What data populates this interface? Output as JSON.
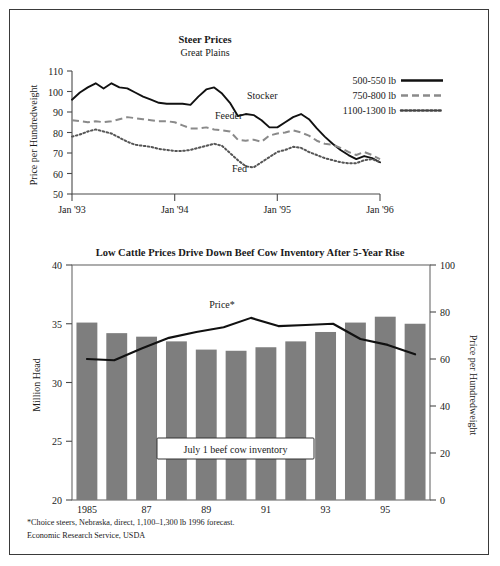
{
  "figure": {
    "footnotes": [
      "*Choice steers, Nebraska, direct, 1,100–1,300 lb 1996 forecast.",
      "Economic Research Service, USDA"
    ]
  },
  "chart_data": [
    {
      "id": "steer-prices",
      "type": "line",
      "title": "Steer Prices",
      "subtitle": "Great Plains",
      "xlabel": "",
      "ylabel": "Price per Hundredweight",
      "ylim": [
        50,
        110
      ],
      "yticks": [
        50,
        60,
        70,
        80,
        90,
        100,
        110
      ],
      "xlim": [
        0,
        36
      ],
      "xticks": [
        0,
        12,
        24,
        36
      ],
      "xticklabels": [
        "Jan '93",
        "Jan '94",
        "Jan '95",
        "Jan '96"
      ],
      "grid": false,
      "legend_position": "upper-right",
      "annotations": [
        {
          "text": "Stocker",
          "x": 20.5,
          "y": 99.5
        },
        {
          "text": "Feeder",
          "x": 17.0,
          "y": 88.5
        },
        {
          "text": "Fed",
          "x": 22.0,
          "y": 66.5
        }
      ],
      "series": [
        {
          "name": "500-550 lb",
          "style": "solid",
          "values": [
            96.0,
            99.5,
            102.0,
            104.0,
            101.5,
            104.0,
            102.0,
            101.5,
            99.5,
            97.5,
            96.0,
            94.5,
            94.0,
            94.0,
            94.0,
            93.5,
            97.5,
            101.0,
            102.0,
            99.0,
            94.5,
            88.0,
            89.0,
            88.5,
            86.0,
            82.5,
            82.5,
            85.0,
            87.5,
            89.0,
            86.5,
            82.0,
            78.0,
            74.5,
            71.5,
            69.0,
            67.0,
            68.5,
            67.5,
            65.5
          ]
        },
        {
          "name": "750-800 lb",
          "style": "dashed",
          "values": [
            86.0,
            85.5,
            85.0,
            85.5,
            85.0,
            85.5,
            86.5,
            87.5,
            87.0,
            86.5,
            86.0,
            85.5,
            85.5,
            85.0,
            83.5,
            82.0,
            82.0,
            82.5,
            81.5,
            81.0,
            80.5,
            76.5,
            76.0,
            76.5,
            75.5,
            78.5,
            79.5,
            80.0,
            81.0,
            80.0,
            78.5,
            76.0,
            74.5,
            74.0,
            72.5,
            70.5,
            69.0,
            70.5,
            69.0,
            67.0
          ]
        },
        {
          "name": "1100-1300 lb",
          "style": "dotted",
          "values": [
            78.0,
            79.0,
            80.5,
            81.5,
            80.5,
            79.5,
            77.5,
            75.5,
            74.0,
            73.5,
            73.0,
            72.0,
            71.5,
            71.0,
            71.0,
            71.5,
            72.5,
            73.5,
            74.5,
            73.5,
            70.0,
            66.5,
            63.5,
            63.0,
            65.5,
            68.0,
            70.5,
            71.5,
            73.0,
            72.5,
            70.5,
            69.0,
            67.5,
            66.5,
            65.5,
            65.0,
            65.0,
            66.5,
            67.0,
            65.5
          ]
        }
      ]
    },
    {
      "id": "beef-cow-inventory",
      "type": "bar",
      "title": "Low Cattle Prices Drive Down Beef Cow Inventory After 5-Year Rise",
      "xlabel": "",
      "ylabel": "Million Head",
      "y2label": "Price per Hundredweight",
      "ylim": [
        20,
        40
      ],
      "yticks": [
        20,
        25,
        30,
        35,
        40
      ],
      "y2lim": [
        0,
        100
      ],
      "y2ticks": [
        0,
        20,
        40,
        60,
        80,
        100
      ],
      "grid": false,
      "categories": [
        "1985",
        "86",
        "87",
        "88",
        "89",
        "90",
        "91",
        "92",
        "93",
        "94",
        "95",
        "96"
      ],
      "xticklabels_shown": [
        "1985",
        "87",
        "89",
        "91",
        "93",
        "95"
      ],
      "values": [
        35.1,
        34.2,
        33.9,
        33.5,
        32.8,
        32.7,
        33.0,
        33.5,
        34.3,
        35.1,
        35.6,
        35.0
      ],
      "bar_color": "#7e7e7e",
      "series": [
        {
          "name": "Price*",
          "axis": "right",
          "style": "solid",
          "values": [
            60.0,
            59.5,
            64.5,
            69.0,
            71.5,
            73.5,
            77.5,
            74.0,
            74.5,
            75.0,
            68.5,
            66.0,
            62.0
          ]
        }
      ],
      "annotations": [
        {
          "text": "Price*",
          "x": 5.6,
          "y": 80.5
        },
        {
          "text": "July 1 beef cow inventory",
          "type": "boxed"
        }
      ]
    }
  ]
}
